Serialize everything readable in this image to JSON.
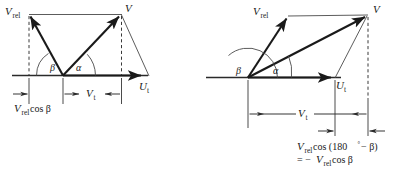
{
  "figure": {
    "background_color": "#ffffff",
    "ink_color": "#1a1a1a"
  },
  "left_diagram": {
    "name": "acute-beta-velocity-triangle",
    "labels": {
      "v_rel": "V",
      "v_rel_sub": "rel",
      "v": "V",
      "u_t": "U",
      "u_t_sub": "t",
      "v_t": "V",
      "v_t_sub": "t",
      "beta": "β",
      "alpha": "α"
    },
    "dimension_labels": {
      "vrel_cos_beta": {
        "main": "V",
        "sub": "rel",
        "tail": " cos β"
      },
      "vt": {
        "main": "V",
        "sub": "t"
      }
    }
  },
  "right_diagram": {
    "name": "obtuse-beta-velocity-triangle",
    "labels": {
      "v_rel": "V",
      "v_rel_sub": "rel",
      "v": "V",
      "u_t": "U",
      "u_t_sub": "t",
      "v_t": "V",
      "v_t_sub": "t",
      "beta": "β",
      "alpha": "α"
    },
    "dimension_labels": {
      "vt": {
        "main": "V",
        "sub": "t"
      },
      "vrel_cos_180_minus_beta": {
        "line1_a": "V",
        "line1_sub": "rel",
        "line1_b": " cos (180",
        "line1_deg": "°",
        "line1_c": " − β)",
        "line2_a": "= −",
        "line2_b": "V",
        "line2_sub": "rel",
        "line2_c": " cos β"
      }
    }
  }
}
